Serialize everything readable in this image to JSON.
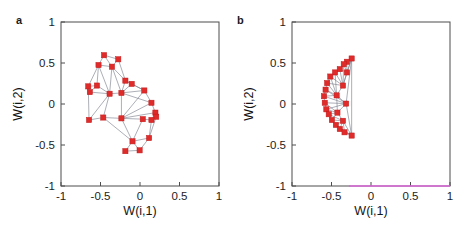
{
  "figure": {
    "background": "#ffffff",
    "marker_color": "#e02b2b",
    "marker_edge_color": "#c01818",
    "edge_color": "#7a7f8c",
    "axis_color": "#4d4d4d",
    "magenta_line_color": "#dd66dd"
  },
  "panels": [
    {
      "label": "a",
      "xlabel": "W(i,1)",
      "ylabel": "W(i,2)",
      "xticks": [
        "-1",
        "-0.5",
        "0",
        "0.5",
        "1"
      ],
      "yticks": [
        "1",
        "0.5",
        "0",
        "-0.5",
        "-1"
      ],
      "xtick_values": [
        -1,
        -0.5,
        0,
        0.5,
        1
      ],
      "ytick_values": [
        1,
        0.5,
        0,
        -0.5,
        -1
      ],
      "has_magenta_baseline": false
    },
    {
      "label": "b",
      "xlabel": "W(i,1)",
      "ylabel": "W(i,2)",
      "xticks": [
        "-1",
        "-0.5",
        "0",
        "0.5",
        "1"
      ],
      "yticks": [
        "1",
        "0.5",
        "0",
        "-0.5",
        "-1"
      ],
      "xtick_values": [
        -1,
        -0.5,
        0,
        0.5,
        1
      ],
      "ytick_values": [
        1,
        0.5,
        0,
        -0.5,
        -1
      ],
      "has_magenta_baseline": true
    }
  ],
  "chart_data": [
    {
      "type": "scatter",
      "title": "a",
      "xlabel": "W(i,1)",
      "ylabel": "W(i,2)",
      "xlim": [
        -1,
        1
      ],
      "ylim": [
        -1,
        1
      ],
      "grid": false,
      "legend": "none",
      "marker": "filled-square-red",
      "edges_drawn": true,
      "points": [
        [
          -0.455,
          0.595
        ],
        [
          -0.275,
          0.545
        ],
        [
          -0.525,
          0.475
        ],
        [
          -0.355,
          0.455
        ],
        [
          -0.655,
          0.215
        ],
        [
          -0.635,
          0.145
        ],
        [
          -0.545,
          0.225
        ],
        [
          -0.185,
          0.285
        ],
        [
          -0.105,
          0.245
        ],
        [
          -0.235,
          0.135
        ],
        [
          -0.385,
          0.125
        ],
        [
          0.055,
          0.165
        ],
        [
          0.145,
          0.015
        ],
        [
          0.195,
          -0.105
        ],
        [
          0.205,
          -0.155
        ],
        [
          -0.645,
          -0.195
        ],
        [
          -0.465,
          -0.165
        ],
        [
          -0.235,
          -0.175
        ],
        [
          0.035,
          -0.185
        ],
        [
          0.145,
          -0.195
        ],
        [
          0.115,
          -0.415
        ],
        [
          -0.095,
          -0.455
        ],
        [
          -0.005,
          -0.565
        ],
        [
          -0.185,
          -0.575
        ]
      ],
      "edges": [
        [
          0,
          1
        ],
        [
          0,
          2
        ],
        [
          0,
          3
        ],
        [
          1,
          3
        ],
        [
          1,
          7
        ],
        [
          2,
          3
        ],
        [
          2,
          4
        ],
        [
          2,
          6
        ],
        [
          3,
          7
        ],
        [
          3,
          10
        ],
        [
          4,
          5
        ],
        [
          4,
          6
        ],
        [
          5,
          6
        ],
        [
          5,
          10
        ],
        [
          6,
          10
        ],
        [
          7,
          8
        ],
        [
          7,
          9
        ],
        [
          7,
          11
        ],
        [
          8,
          9
        ],
        [
          8,
          11
        ],
        [
          9,
          10
        ],
        [
          9,
          11
        ],
        [
          9,
          12
        ],
        [
          10,
          15
        ],
        [
          10,
          16
        ],
        [
          11,
          12
        ],
        [
          12,
          13
        ],
        [
          12,
          17
        ],
        [
          13,
          14
        ],
        [
          13,
          17
        ],
        [
          14,
          19
        ],
        [
          15,
          16
        ],
        [
          16,
          17
        ],
        [
          17,
          18
        ],
        [
          17,
          21
        ],
        [
          18,
          19
        ],
        [
          18,
          21
        ],
        [
          19,
          20
        ],
        [
          20,
          21
        ],
        [
          20,
          22
        ],
        [
          21,
          22
        ],
        [
          21,
          23
        ],
        [
          22,
          23
        ],
        [
          16,
          21
        ],
        [
          9,
          17
        ],
        [
          3,
          9
        ],
        [
          2,
          10
        ],
        [
          13,
          19
        ],
        [
          11,
          17
        ],
        [
          4,
          15
        ],
        [
          20,
          14
        ]
      ],
      "n_points": 24
    },
    {
      "type": "scatter",
      "title": "b",
      "xlabel": "W(i,1)",
      "ylabel": "W(i,2)",
      "xlim": [
        -1,
        1
      ],
      "ylim": [
        -1,
        1
      ],
      "grid": false,
      "legend": "none",
      "marker": "filled-square-red",
      "edges_drawn": true,
      "points": [
        [
          -0.245,
          0.555
        ],
        [
          -0.305,
          0.515
        ],
        [
          -0.345,
          0.485
        ],
        [
          -0.395,
          0.425
        ],
        [
          -0.455,
          0.385
        ],
        [
          -0.515,
          0.335
        ],
        [
          -0.555,
          0.255
        ],
        [
          -0.575,
          0.175
        ],
        [
          -0.595,
          0.095
        ],
        [
          -0.585,
          0.015
        ],
        [
          -0.565,
          -0.065
        ],
        [
          -0.535,
          -0.125
        ],
        [
          -0.495,
          -0.195
        ],
        [
          -0.445,
          -0.255
        ],
        [
          -0.395,
          -0.305
        ],
        [
          -0.335,
          -0.345
        ],
        [
          -0.245,
          -0.385
        ],
        [
          -0.305,
          0.385
        ],
        [
          -0.355,
          0.225
        ],
        [
          -0.315,
          0.005
        ],
        [
          -0.435,
          0.105
        ],
        [
          -0.425,
          -0.105
        ],
        [
          -0.355,
          -0.205
        ]
      ],
      "edges": [
        [
          0,
          1
        ],
        [
          0,
          2
        ],
        [
          0,
          16
        ],
        [
          0,
          17
        ],
        [
          0,
          19
        ],
        [
          1,
          2
        ],
        [
          1,
          17
        ],
        [
          2,
          3
        ],
        [
          2,
          17
        ],
        [
          2,
          18
        ],
        [
          3,
          4
        ],
        [
          3,
          17
        ],
        [
          3,
          18
        ],
        [
          4,
          5
        ],
        [
          4,
          18
        ],
        [
          4,
          20
        ],
        [
          5,
          6
        ],
        [
          5,
          18
        ],
        [
          5,
          20
        ],
        [
          6,
          7
        ],
        [
          6,
          18
        ],
        [
          6,
          20
        ],
        [
          7,
          8
        ],
        [
          7,
          20
        ],
        [
          7,
          19
        ],
        [
          8,
          9
        ],
        [
          8,
          19
        ],
        [
          8,
          20
        ],
        [
          9,
          10
        ],
        [
          9,
          19
        ],
        [
          9,
          21
        ],
        [
          10,
          11
        ],
        [
          10,
          21
        ],
        [
          10,
          19
        ],
        [
          11,
          12
        ],
        [
          11,
          21
        ],
        [
          11,
          22
        ],
        [
          12,
          13
        ],
        [
          12,
          21
        ],
        [
          12,
          22
        ],
        [
          13,
          14
        ],
        [
          13,
          22
        ],
        [
          13,
          16
        ],
        [
          14,
          15
        ],
        [
          14,
          22
        ],
        [
          14,
          16
        ],
        [
          15,
          16
        ],
        [
          15,
          22
        ],
        [
          16,
          19
        ],
        [
          16,
          22
        ],
        [
          17,
          18
        ],
        [
          18,
          20
        ],
        [
          19,
          20
        ],
        [
          19,
          21
        ],
        [
          20,
          21
        ],
        [
          21,
          22
        ],
        [
          0,
          18
        ]
      ],
      "n_points": 23,
      "baseline_annotation": "magenta line along y = -1 from x = -0.28 to x = 1"
    }
  ]
}
